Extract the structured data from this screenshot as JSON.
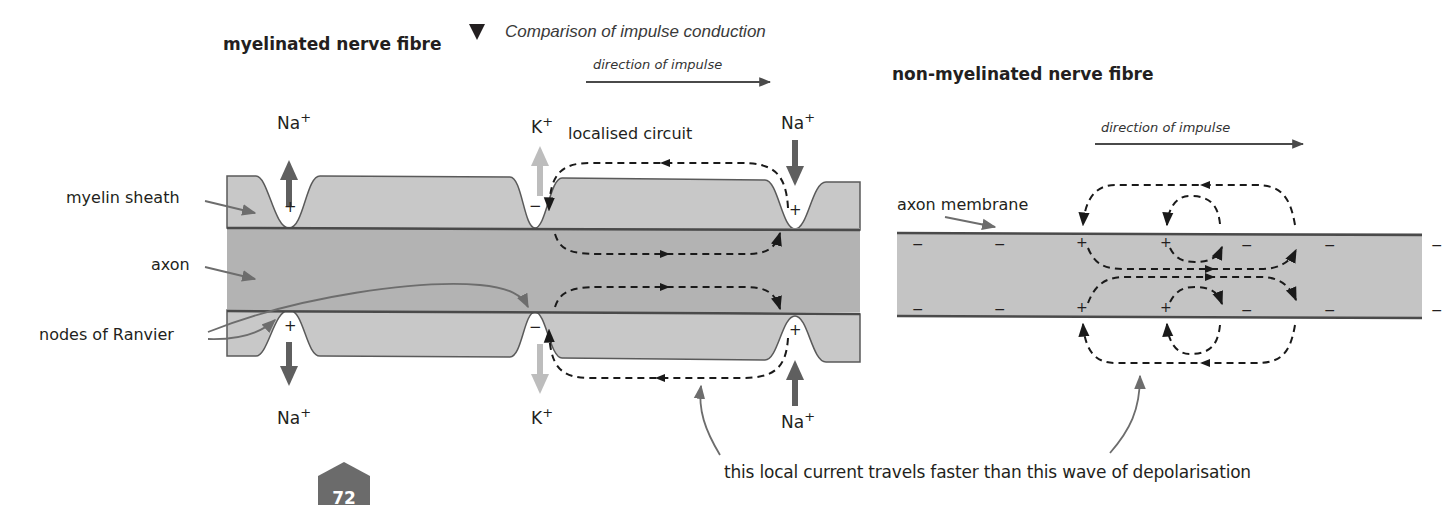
{
  "figure": {
    "title": "Comparison of impulse conduction",
    "title_marker": "triangle-down",
    "caption": "this local current travels faster than this wave of depolarisation",
    "page_number": "72"
  },
  "myelinated": {
    "heading": "myelinated nerve fibre",
    "direction_label": "direction of impulse",
    "circuit_label": "localised circuit",
    "labels": {
      "myelin_sheath": "myelin sheath",
      "axon": "axon",
      "nodes": "nodes of Ranvier"
    },
    "ions": {
      "top_left": "Na",
      "top_mid": "K",
      "top_right": "Na",
      "bottom_left": "Na",
      "bottom_mid": "K",
      "bottom_right": "Na",
      "sign": "+"
    },
    "charges": {
      "node1_top": "+",
      "node2_top": "−",
      "node3_top": "+",
      "node1_bottom": "+",
      "node2_bottom": "−",
      "node3_bottom": "+"
    }
  },
  "non_myelinated": {
    "heading": "non-myelinated nerve fibre",
    "direction_label": "direction of impulse",
    "labels": {
      "axon_membrane": "axon membrane"
    },
    "charges_top": [
      "−",
      "−",
      "+",
      "+",
      "−",
      "−",
      "−"
    ],
    "charges_bottom": [
      "−",
      "−",
      "+",
      "+",
      "−",
      "−",
      "−"
    ]
  },
  "colors": {
    "myelin": "#c8c8c8",
    "axon": "#b3b3b3",
    "membrane_line": "#4a4a4a",
    "na_arrow": "#5f5f5f",
    "k_arrow": "#bdbdbd",
    "pointer": "#6d6d6d",
    "dashed_current": "#1a1a1a",
    "badge": "#6b6b6b"
  }
}
